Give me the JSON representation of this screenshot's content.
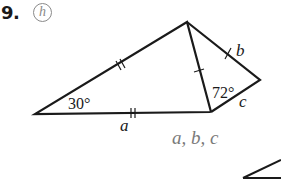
{
  "problem": {
    "number": "9.",
    "hint_icon": "h",
    "answer_variables": "a, b, c"
  },
  "figure": {
    "angle_labels": {
      "left_angle": "30°",
      "right_angle": "72°"
    },
    "side_labels": {
      "a": "a",
      "b": "b",
      "c": "c"
    },
    "tick_marks": {
      "left_upper_side": "double",
      "bottom_side": "double",
      "middle_side": "single",
      "right_upper_side": "single"
    },
    "colors": {
      "line": "#1a1a1a",
      "hint": "#8a8a8a",
      "answer_text": "#7a7a7a"
    }
  }
}
